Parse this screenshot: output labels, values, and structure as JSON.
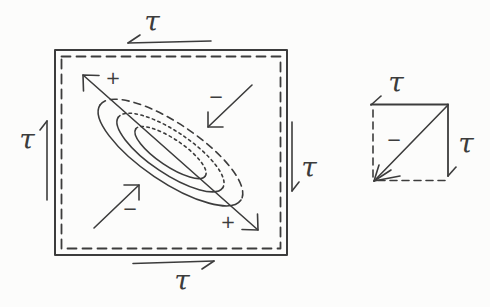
{
  "colors": {
    "background": "#fcfcfb",
    "ink": "#3c3c3c"
  },
  "main_element": {
    "labels": {
      "tau_top": "τ",
      "tau_left": "τ",
      "tau_right": "τ",
      "tau_bottom": "τ",
      "plus_upper_left": "+",
      "minus_upper_right": "−",
      "minus_lower_left": "−",
      "plus_lower_right": "+"
    }
  },
  "inset_element": {
    "labels": {
      "tau_top": "τ",
      "tau_right": "τ",
      "minus_center": "−"
    }
  }
}
